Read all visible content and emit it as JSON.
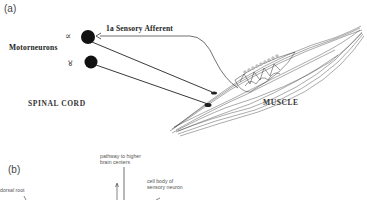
{
  "panel_a": {
    "label": "(a)",
    "motorneurons_label": "Motorneurons",
    "alpha_symbol": "∝",
    "gamma_symbol": "४",
    "afferent_label": "1a Sensory Afferent",
    "spinal_cord_label": "SPINAL CORD",
    "muscle_label": "MUSCLE"
  },
  "panel_b": {
    "label": "(b)",
    "dorsal_root_label": "dorsal root",
    "pathway_label_line1": "pathway to higher",
    "pathway_label_line2": "brain centers",
    "cell_body_label_line1": "cell body of",
    "cell_body_label_line2": "sensory neuron"
  }
}
